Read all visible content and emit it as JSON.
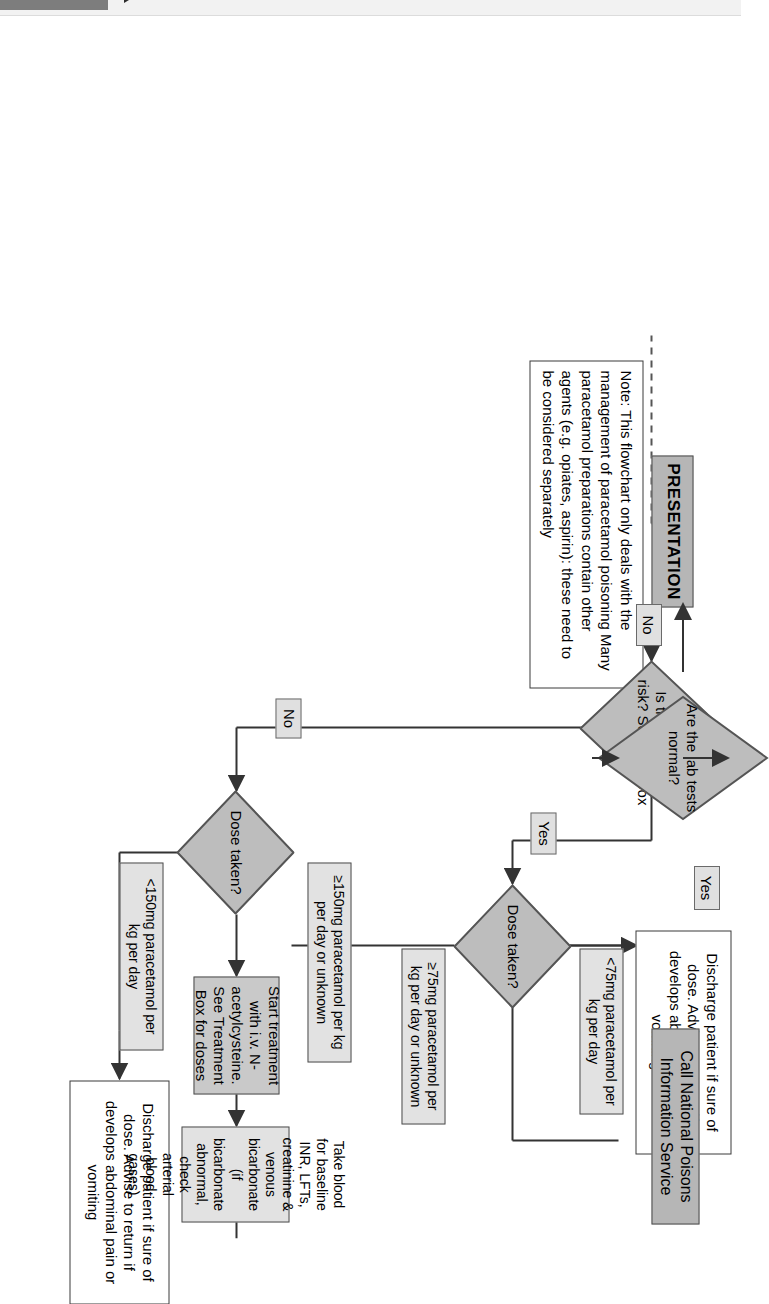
{
  "header": {
    "chapter_title": "PARACETAMOL",
    "tab_marker": "chapter-tab",
    "triangle": "play-triangle-icon"
  },
  "flowchart": {
    "title": "Paracetamol poisoning management flowchart",
    "note": {
      "label": "flowchart-note",
      "text": "Note: This flowchart only deals with the management of paracetamol poisoning Many paracetamol preparations contain other agents (e.g. opiates, aspirin): these need to be considered separately"
    },
    "nodes": {
      "presentation": "PRESENTATION",
      "at_risk": "Is the patient at risk? See Risk Box",
      "dose_taken_upper": "Dose taken?",
      "dose_taken_lower": "Dose taken?",
      "discharge_upper": "Discharge patient if sure of dose. Advise to return if develops abdominal pain or vomiting",
      "discharge_lower": "Discharge patient if sure of dose. Advise to return if develops abdominal pain or vomiting",
      "start_treatment": "Start treatment  with i.v. N-acetylcysteine. See Treatment Box for doses",
      "take_blood": "Take blood for baseline INR, LFTs, creatinine & venous bicarbonate (if bicarbonate abnormal, check arterial blood gases)",
      "lab_tests": "Are the lab tests normal?",
      "call_poisons": "Call National Poisons Information Service"
    },
    "edge_labels": {
      "at_risk_yes": "Yes",
      "at_risk_no": "No",
      "dose_upper_low": "<75mg paracetamol per kg per day",
      "dose_upper_high": "≥75mg paracetamol per kg per day or unknown",
      "dose_lower_low": "<150mg paracetamol per kg per day",
      "dose_lower_high": "≥150mg paracetamol per kg per day or unknown",
      "lab_no": "No",
      "lab_yes": "Yes"
    },
    "colors": {
      "node_dark": "#b6b6b6",
      "node_mid": "#c9c9c9",
      "node_light": "#e2e2e2",
      "diamond_fill": "#bdbdbd",
      "label_fill": "#e0e0e0",
      "stroke": "#333333",
      "page_background": "#ffffff"
    }
  }
}
